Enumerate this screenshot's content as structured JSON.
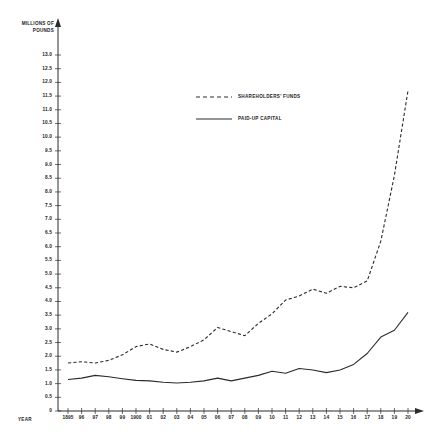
{
  "chart_data": {
    "type": "line",
    "title": "",
    "ylabel": "MILLIONS OF POUNDS",
    "xlabel": "YEAR",
    "grid": false,
    "legend_position": "upper-center",
    "ylim": [
      0,
      13.0
    ],
    "ytick_step": 0.5,
    "yticks": [
      "13.0",
      "12.5",
      "12.0",
      "11.5",
      "11.0",
      "10.5",
      "10.0",
      "9.5",
      "9.0",
      "8.5",
      "8.0",
      "7.5",
      "7.0",
      "6.5",
      "6.0",
      "5.5",
      "5.0",
      "4.5",
      "4.0",
      "3.5",
      "3.0",
      "2.5",
      "2.0",
      "1.5",
      "1.0",
      "0.5",
      "0"
    ],
    "categories": [
      "1895",
      "96",
      "97",
      "98",
      "99",
      "1900",
      "01",
      "02",
      "03",
      "04",
      "05",
      "06",
      "07",
      "08",
      "09",
      "10",
      "11",
      "12",
      "13",
      "14",
      "15",
      "16",
      "17",
      "18",
      "19",
      "20"
    ],
    "x": [
      1895,
      1896,
      1897,
      1898,
      1899,
      1900,
      1901,
      1902,
      1903,
      1904,
      1905,
      1906,
      1907,
      1908,
      1909,
      1910,
      1911,
      1912,
      1913,
      1914,
      1915,
      1916,
      1917,
      1918,
      1919,
      1920
    ],
    "series": [
      {
        "name": "SHAREHOLDERS' FUNDS",
        "style": "dashed",
        "color": "#2b2b2b",
        "values": [
          1.75,
          1.8,
          1.75,
          1.85,
          2.05,
          2.35,
          2.45,
          2.25,
          2.15,
          2.35,
          2.6,
          3.05,
          2.9,
          2.75,
          3.2,
          3.55,
          4.05,
          4.2,
          4.45,
          4.3,
          4.55,
          4.5,
          4.75,
          6.2,
          8.6,
          11.7
        ]
      },
      {
        "name": "PAID-UP CAPITAL",
        "style": "solid",
        "color": "#2b2b2b",
        "values": [
          1.15,
          1.2,
          1.3,
          1.25,
          1.18,
          1.12,
          1.1,
          1.05,
          1.02,
          1.05,
          1.1,
          1.2,
          1.1,
          1.2,
          1.3,
          1.45,
          1.38,
          1.55,
          1.5,
          1.4,
          1.5,
          1.7,
          2.1,
          2.7,
          2.95,
          3.6
        ]
      }
    ],
    "annotations": []
  },
  "legend": {
    "entries": [
      {
        "label": "SHAREHOLDERS' FUNDS",
        "style": "dashed"
      },
      {
        "label": "PAID-UP CAPITAL",
        "style": "solid"
      }
    ]
  }
}
